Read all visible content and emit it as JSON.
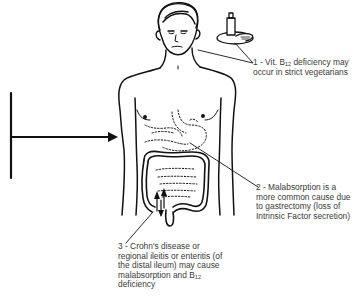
{
  "diagram": {
    "type": "anatomical-illustration",
    "colors": {
      "ink": "#111111",
      "text": "#3a3a3a",
      "background": "#ffffff"
    },
    "annotations": [
      {
        "number": "1",
        "prefix": "1 - Vit. B",
        "subscript": "12",
        "suffix": " deficiency may occur in strict vegetarians",
        "points_to": "plate-with-food-and-bottle"
      },
      {
        "number": "2",
        "text": "2 - Malabsorption is a more common cause due to gastrectomy (loss of Intrinsic Factor secretion)",
        "points_to": "stomach"
      },
      {
        "number": "3",
        "prefix": "3 - Crohn's disease or regional ileitis or enteritis (of the distal ileum) may cause malabsorption and B",
        "subscript": "12",
        "suffix": " deficiency",
        "points_to": "distal-ileum"
      }
    ],
    "elements": [
      "left-bar-with-arrow",
      "male-torso-figure",
      "plate-with-bottle",
      "stomach-outline-dotted",
      "large-intestine",
      "small-intestine-dotted"
    ]
  }
}
